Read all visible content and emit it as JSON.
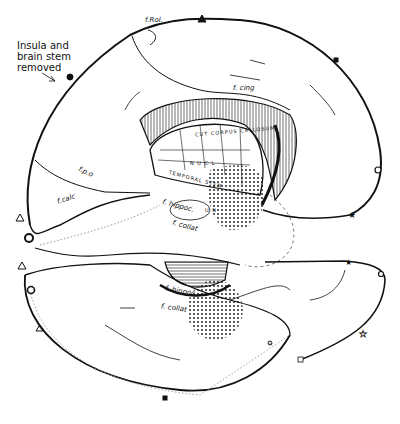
{
  "figure": {
    "type": "anatomical line drawing",
    "annotation": "Insula and\nbrain stem\nremoved",
    "labels": {
      "f_rol": "f.Rol.",
      "f_cing": "f. cing",
      "f_po": "f.p.o",
      "f_calc": "f.calc",
      "f_hippoc_upper": "f. hippoc.",
      "f_collat_upper": "f. collat",
      "f_hippoc_lower": "f. hippoc",
      "f_collat_lower": "f. collat",
      "corpus_callosum": "CUT CORPUS CALLOSUM",
      "temporal_stem": "TEMPORAL STEM",
      "lateral_n": "N U C L",
      "un": "U N",
      "g": "G"
    },
    "markers": [
      "filled-circle",
      "filled-triangle",
      "filled-square",
      "open-circle",
      "star",
      "open-triangle",
      "open-star",
      "open-square"
    ],
    "colors": {
      "ink": "#111111",
      "background": "#ffffff"
    }
  }
}
